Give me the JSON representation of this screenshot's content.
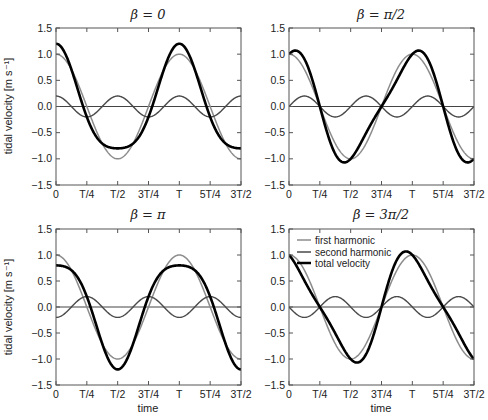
{
  "figure": {
    "ylabel": "tidal velocity [m s⁻¹]",
    "xlabel": "time",
    "xticks": [
      "0",
      "T/4",
      "T/2",
      "3T/4",
      "T",
      "5T/4",
      "3T/2"
    ],
    "yticks": [
      "1.5",
      "1.0",
      "0.5",
      "0.0",
      "−0.5",
      "−1.0",
      "−1.5"
    ],
    "legend": [
      "first harmonic",
      "second harmonic",
      "total velocity"
    ],
    "colors": {
      "first": "#8c8c8c",
      "second": "#4a4a4a",
      "total": "#000000",
      "axis": "#555555"
    }
  },
  "chart_data": [
    {
      "type": "line",
      "title": "β = 0",
      "xlabel": "",
      "ylabel": "tidal velocity [m s⁻¹]",
      "xlim": [
        0,
        1.5
      ],
      "ylim": [
        -1.5,
        1.5
      ],
      "x_tick_labels": [
        "0",
        "T/4",
        "T/2",
        "3T/4",
        "T",
        "5T/4",
        "3T/2"
      ],
      "beta": 0,
      "series": [
        {
          "name": "first harmonic",
          "amplitude": 1.0,
          "formula": "cos(2πt/T)",
          "x": [
            0,
            0.25,
            0.5,
            0.75,
            1,
            1.25,
            1.5
          ],
          "values": [
            1,
            0,
            -1,
            0,
            1,
            0,
            -1
          ]
        },
        {
          "name": "second harmonic",
          "amplitude": 0.2,
          "formula": "0.2cos(4πt/T)",
          "x": [
            0,
            0.25,
            0.5,
            0.75,
            1,
            1.25,
            1.5
          ],
          "values": [
            0.2,
            -0.2,
            0.2,
            -0.2,
            0.2,
            -0.2,
            0.2
          ]
        },
        {
          "name": "total velocity",
          "x": [
            0,
            0.25,
            0.5,
            0.75,
            1,
            1.25,
            1.5
          ],
          "values": [
            1.2,
            -0.2,
            -0.8,
            -0.2,
            1.2,
            -0.2,
            -0.8
          ]
        }
      ]
    },
    {
      "type": "line",
      "title": "β = π/2",
      "xlabel": "",
      "ylabel": "",
      "xlim": [
        0,
        1.5
      ],
      "ylim": [
        -1.5,
        1.5
      ],
      "x_tick_labels": [
        "0",
        "T/4",
        "T/2",
        "3T/4",
        "T",
        "5T/4",
        "3T/2"
      ],
      "beta": 1.5708,
      "series": [
        {
          "name": "first harmonic",
          "amplitude": 1.0,
          "x": [
            0,
            0.25,
            0.5,
            0.75,
            1,
            1.25,
            1.5
          ],
          "values": [
            1,
            0,
            -1,
            0,
            1,
            0,
            -1
          ]
        },
        {
          "name": "second harmonic",
          "amplitude": 0.2,
          "x": [
            0,
            0.125,
            0.25,
            0.375,
            0.5
          ],
          "values": [
            0,
            0.2,
            0,
            -0.2,
            0
          ]
        },
        {
          "name": "total velocity",
          "x": [
            0,
            0.25,
            0.5,
            0.75,
            1,
            1.25,
            1.5
          ],
          "values": [
            1.0,
            0,
            -1.0,
            0,
            1.0,
            0,
            -1.0
          ],
          "peak": 1.07
        }
      ]
    },
    {
      "type": "line",
      "title": "β = π",
      "xlabel": "time",
      "ylabel": "tidal velocity [m s⁻¹]",
      "xlim": [
        0,
        1.5
      ],
      "ylim": [
        -1.5,
        1.5
      ],
      "x_tick_labels": [
        "0",
        "T/4",
        "T/2",
        "3T/4",
        "T",
        "5T/4",
        "3T/2"
      ],
      "beta": 3.1416,
      "series": [
        {
          "name": "first harmonic",
          "amplitude": 1.0,
          "x": [
            0,
            0.25,
            0.5,
            0.75,
            1,
            1.25,
            1.5
          ],
          "values": [
            1,
            0,
            -1,
            0,
            1,
            0,
            -1
          ]
        },
        {
          "name": "second harmonic",
          "amplitude": 0.2,
          "x": [
            0,
            0.25,
            0.5,
            0.75,
            1,
            1.25,
            1.5
          ],
          "values": [
            -0.2,
            0.2,
            -0.2,
            0.2,
            -0.2,
            0.2,
            -0.2
          ]
        },
        {
          "name": "total velocity",
          "x": [
            0,
            0.25,
            0.5,
            0.75,
            1,
            1.25,
            1.5
          ],
          "values": [
            0.8,
            0.2,
            -1.2,
            0.2,
            0.8,
            0.2,
            -1.2
          ]
        }
      ]
    },
    {
      "type": "line",
      "title": "β = 3π/2",
      "xlabel": "time",
      "ylabel": "",
      "xlim": [
        0,
        1.5
      ],
      "ylim": [
        -1.5,
        1.5
      ],
      "x_tick_labels": [
        "0",
        "T/4",
        "T/2",
        "3T/4",
        "T",
        "5T/4",
        "3T/2"
      ],
      "legend": [
        "first harmonic",
        "second harmonic",
        "total velocity"
      ],
      "legend_position": "upper left",
      "beta": 4.7124,
      "series": [
        {
          "name": "first harmonic",
          "amplitude": 1.0,
          "x": [
            0,
            0.25,
            0.5,
            0.75,
            1,
            1.25,
            1.5
          ],
          "values": [
            1,
            0,
            -1,
            0,
            1,
            0,
            -1
          ]
        },
        {
          "name": "second harmonic",
          "amplitude": 0.2,
          "x": [
            0,
            0.125,
            0.25,
            0.375,
            0.5
          ],
          "values": [
            0,
            -0.2,
            0,
            0.2,
            0
          ]
        },
        {
          "name": "total velocity",
          "x": [
            0,
            0.25,
            0.5,
            0.75,
            1,
            1.25,
            1.5
          ],
          "values": [
            1.0,
            0,
            -1.0,
            0,
            1.0,
            0,
            -1.0
          ],
          "peak": 1.07
        }
      ]
    }
  ]
}
